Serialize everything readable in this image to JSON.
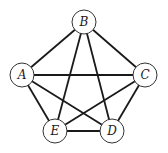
{
  "graph": {
    "type": "complete graph",
    "nodes": [
      {
        "id": "B",
        "label": "B",
        "x": 84,
        "y": 22
      },
      {
        "id": "A",
        "label": "A",
        "x": 22,
        "y": 75
      },
      {
        "id": "C",
        "label": "C",
        "x": 145,
        "y": 75
      },
      {
        "id": "E",
        "label": "E",
        "x": 55,
        "y": 131
      },
      {
        "id": "D",
        "label": "D",
        "x": 112,
        "y": 131
      }
    ],
    "edges": [
      [
        "A",
        "B"
      ],
      [
        "B",
        "C"
      ],
      [
        "A",
        "C"
      ],
      [
        "A",
        "E"
      ],
      [
        "A",
        "D"
      ],
      [
        "B",
        "E"
      ],
      [
        "B",
        "D"
      ],
      [
        "C",
        "E"
      ],
      [
        "C",
        "D"
      ],
      [
        "E",
        "D"
      ]
    ],
    "node_radius": 12
  }
}
